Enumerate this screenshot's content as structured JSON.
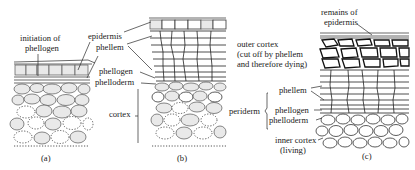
{
  "figure": {
    "panels": [
      {
        "id": "a",
        "caption": "(a)",
        "labels": [
          {
            "text": [
              "initiation of",
              "phellogen"
            ],
            "role": "initiation-of-phellogen"
          }
        ]
      },
      {
        "id": "b",
        "caption": "(b)",
        "labels": [
          {
            "text": [
              "epidermis"
            ],
            "role": "epidermis"
          },
          {
            "text": [
              "phellem"
            ],
            "role": "phellem"
          },
          {
            "text": [
              "phellogen"
            ],
            "role": "phellogen"
          },
          {
            "text": [
              "phelloderm"
            ],
            "role": "phelloderm"
          },
          {
            "text": [
              "cortex"
            ],
            "role": "cortex"
          }
        ]
      },
      {
        "id": "c",
        "caption": "(c)",
        "labels": [
          {
            "text": [
              "remains of",
              "epidermis"
            ],
            "role": "remains-of-epidermis"
          },
          {
            "text": [
              "outer cortex",
              "(cut off by phellem",
              "and therefore dying)"
            ],
            "role": "outer-cortex"
          },
          {
            "text": [
              "periderm"
            ],
            "role": "periderm"
          },
          {
            "text": [
              "phellem"
            ],
            "role": "phellem"
          },
          {
            "text": [
              "phellogen"
            ],
            "role": "phellogen"
          },
          {
            "text": [
              "phelloderm"
            ],
            "role": "phelloderm"
          },
          {
            "text": [
              "inner cortex",
              "(living)"
            ],
            "role": "inner-cortex"
          }
        ]
      }
    ]
  },
  "text": {
    "a_init_1": "initiation of",
    "a_init_2": "phellogen",
    "a_caption": "(a)",
    "b_epidermis": "epidermis",
    "b_phellem": "phellem",
    "b_phellogen": "phellogen",
    "b_phelloderm": "phelloderm",
    "b_cortex": "cortex",
    "b_caption": "(b)",
    "c_remains_1": "remains of",
    "c_remains_2": "epidermis",
    "c_outer_1": "outer cortex",
    "c_outer_2": "(cut off by phellem",
    "c_outer_3": "and therefore dying)",
    "c_periderm": "periderm",
    "c_phellem": "phellem",
    "c_phellogen": "phellogen",
    "c_phelloderm": "phelloderm",
    "c_inner_1": "inner cortex",
    "c_inner_2": "(living)",
    "c_caption": "(c)"
  }
}
